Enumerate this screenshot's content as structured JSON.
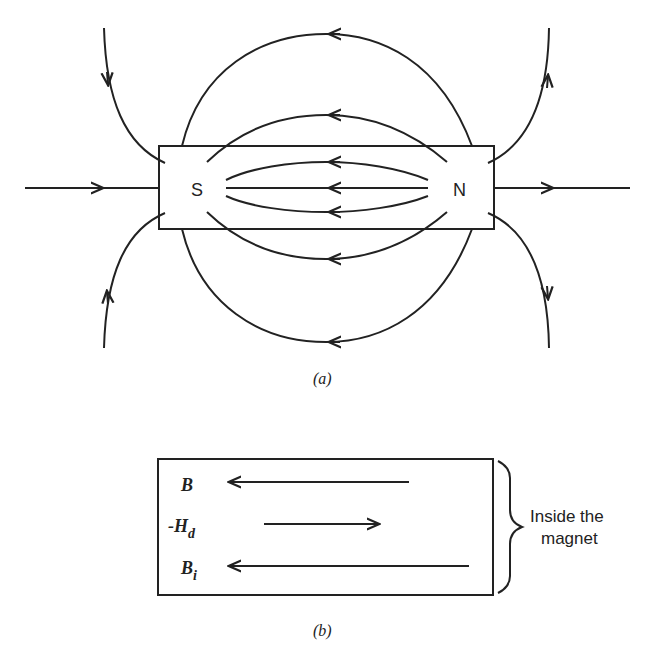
{
  "figure_a": {
    "caption": "(a)",
    "magnet": {
      "south_label": "S",
      "north_label": "N"
    },
    "description": "Bar magnet with external field lines running from N to S outside, and internal B lines running from N to S inside"
  },
  "figure_b": {
    "caption": "(b)",
    "rows": [
      {
        "symbol": "B",
        "subscript": "",
        "prefix": "",
        "direction": "left"
      },
      {
        "symbol": "H",
        "subscript": "d",
        "prefix": "-",
        "direction": "right"
      },
      {
        "symbol": "B",
        "subscript": "i",
        "prefix": "",
        "direction": "left"
      }
    ],
    "bracket_label_line1": "Inside the",
    "bracket_label_line2": "magnet"
  }
}
